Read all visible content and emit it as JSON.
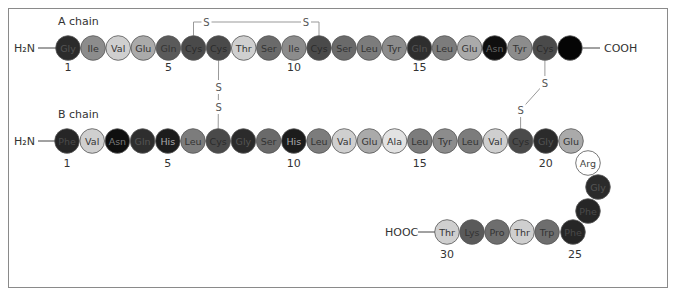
{
  "diagram": {
    "a_chain": {
      "label": "A chain",
      "n_terminus": "H₂N",
      "c_terminus": "COOH",
      "residues": [
        {
          "n": 1,
          "name": "Gly",
          "shade": "#2b2b2b",
          "text": "#555"
        },
        {
          "n": 2,
          "name": "Ile",
          "shade": "#8c8c8c",
          "text": "#333"
        },
        {
          "n": 3,
          "name": "Val",
          "shade": "#cfcfcf",
          "text": "#333"
        },
        {
          "n": 4,
          "name": "Glu",
          "shade": "#aaaaaa",
          "text": "#333"
        },
        {
          "n": 5,
          "name": "Gln",
          "shade": "#5a5a5a",
          "text": "#333"
        },
        {
          "n": 6,
          "name": "Cys",
          "shade": "#4a4a4a",
          "text": "#2a2a2a"
        },
        {
          "n": 7,
          "name": "Cys",
          "shade": "#4a4a4a",
          "text": "#2a2a2a"
        },
        {
          "n": 8,
          "name": "Thr",
          "shade": "#cfcfcf",
          "text": "#333"
        },
        {
          "n": 9,
          "name": "Ser",
          "shade": "#6a6a6a",
          "text": "#333"
        },
        {
          "n": 10,
          "name": "Ile",
          "shade": "#8c8c8c",
          "text": "#333"
        },
        {
          "n": 11,
          "name": "Cys",
          "shade": "#4a4a4a",
          "text": "#2a2a2a"
        },
        {
          "n": 12,
          "name": "Ser",
          "shade": "#6a6a6a",
          "text": "#333"
        },
        {
          "n": 13,
          "name": "Leu",
          "shade": "#7c7c7c",
          "text": "#333"
        },
        {
          "n": 14,
          "name": "Tyr",
          "shade": "#8c8c8c",
          "text": "#333"
        },
        {
          "n": 15,
          "name": "Gln",
          "shade": "#2e2e2e",
          "text": "#555"
        },
        {
          "n": 16,
          "name": "Leu",
          "shade": "#7c7c7c",
          "text": "#333"
        },
        {
          "n": 17,
          "name": "Glu",
          "shade": "#aaaaaa",
          "text": "#333"
        },
        {
          "n": 18,
          "name": "Asn",
          "shade": "#0f0f0f",
          "text": "#666"
        },
        {
          "n": 19,
          "name": "Tyr",
          "shade": "#8c8c8c",
          "text": "#333"
        },
        {
          "n": 20,
          "name": "Cys",
          "shade": "#4a4a4a",
          "text": "#2a2a2a"
        },
        {
          "n": 21,
          "name": "",
          "shade": "#050505",
          "text": "#050505"
        }
      ],
      "position_numbers": [
        "1",
        "5",
        "10",
        "15"
      ]
    },
    "b_chain": {
      "label": "B chain",
      "n_terminus": "H₂N",
      "c_terminus": "HOOC",
      "residues": [
        {
          "n": 1,
          "name": "Phe",
          "shade": "#262626",
          "text": "#4a4a4a"
        },
        {
          "n": 2,
          "name": "Val",
          "shade": "#cfcfcf",
          "text": "#333"
        },
        {
          "n": 3,
          "name": "Asn",
          "shade": "#0f0f0f",
          "text": "#777"
        },
        {
          "n": 4,
          "name": "Gln",
          "shade": "#2e2e2e",
          "text": "#555"
        },
        {
          "n": 5,
          "name": "His",
          "shade": "#1c1c1c",
          "text": "#aaa"
        },
        {
          "n": 6,
          "name": "Leu",
          "shade": "#7c7c7c",
          "text": "#333"
        },
        {
          "n": 7,
          "name": "Cys",
          "shade": "#4a4a4a",
          "text": "#2a2a2a"
        },
        {
          "n": 8,
          "name": "Gly",
          "shade": "#2b2b2b",
          "text": "#555"
        },
        {
          "n": 9,
          "name": "Ser",
          "shade": "#6a6a6a",
          "text": "#333"
        },
        {
          "n": 10,
          "name": "His",
          "shade": "#1c1c1c",
          "text": "#aaa"
        },
        {
          "n": 11,
          "name": "Leu",
          "shade": "#7c7c7c",
          "text": "#333"
        },
        {
          "n": 12,
          "name": "Val",
          "shade": "#cfcfcf",
          "text": "#333"
        },
        {
          "n": 13,
          "name": "Glu",
          "shade": "#aaaaaa",
          "text": "#333"
        },
        {
          "n": 14,
          "name": "Ala",
          "shade": "#e2e2e2",
          "text": "#333"
        },
        {
          "n": 15,
          "name": "Leu",
          "shade": "#7c7c7c",
          "text": "#333"
        },
        {
          "n": 16,
          "name": "Tyr",
          "shade": "#8c8c8c",
          "text": "#333"
        },
        {
          "n": 17,
          "name": "Leu",
          "shade": "#7c7c7c",
          "text": "#333"
        },
        {
          "n": 18,
          "name": "Val",
          "shade": "#cfcfcf",
          "text": "#333"
        },
        {
          "n": 19,
          "name": "Cys",
          "shade": "#4a4a4a",
          "text": "#2a2a2a"
        },
        {
          "n": 20,
          "name": "Gly",
          "shade": "#2b2b2b",
          "text": "#555"
        },
        {
          "n": 21,
          "name": "Glu",
          "shade": "#aaaaaa",
          "text": "#333"
        },
        {
          "n": 22,
          "name": "Arg",
          "shade": "#ffffff",
          "text": "#444"
        },
        {
          "n": 23,
          "name": "Gly",
          "shade": "#2b2b2b",
          "text": "#555"
        },
        {
          "n": 24,
          "name": "Phe",
          "shade": "#262626",
          "text": "#4a4a4a"
        },
        {
          "n": 25,
          "name": "Phe",
          "shade": "#262626",
          "text": "#4a4a4a"
        },
        {
          "n": 26,
          "name": "Trp",
          "shade": "#6e6e6e",
          "text": "#333"
        },
        {
          "n": 27,
          "name": "Thr",
          "shade": "#cfcfcf",
          "text": "#333"
        },
        {
          "n": 28,
          "name": "Pro",
          "shade": "#6e6e6e",
          "text": "#333"
        },
        {
          "n": 29,
          "name": "Lys",
          "shade": "#5a5a5a",
          "text": "#333"
        },
        {
          "n": 30,
          "name": "Thr",
          "shade": "#cfcfcf",
          "text": "#333"
        }
      ],
      "position_numbers": [
        "1",
        "5",
        "10",
        "15",
        "20",
        "25",
        "30"
      ]
    },
    "disulfide_bonds": [
      {
        "from": "A6",
        "to": "A11",
        "atoms": [
          "S",
          "S"
        ]
      },
      {
        "from": "A7",
        "to": "B7",
        "atoms": [
          "S",
          "S"
        ]
      },
      {
        "from": "A20",
        "to": "B19",
        "atoms": [
          "S",
          "S"
        ]
      }
    ]
  }
}
